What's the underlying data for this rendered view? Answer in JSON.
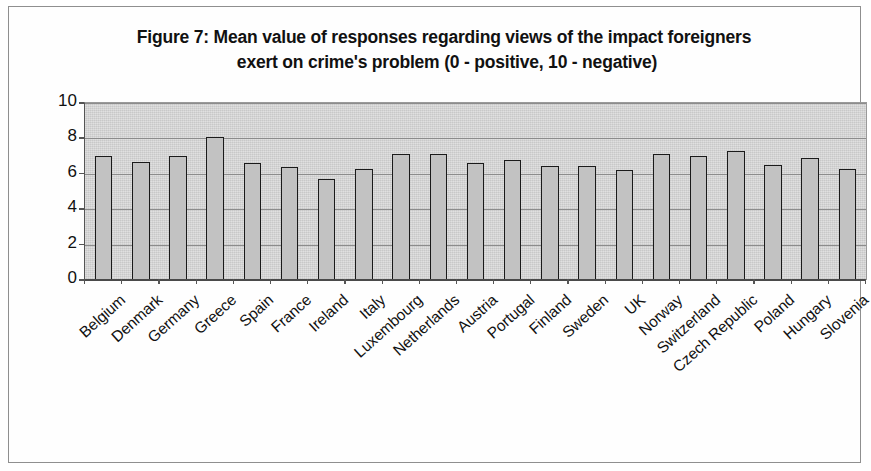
{
  "chart_data": {
    "type": "bar",
    "title": "Figure 7: Mean value of responses regarding views of  the  impact foreigners exert on crime's problem (0 - positive, 10 - negative)",
    "title_line1": "Figure 7: Mean value of responses regarding views of  the  impact foreigners",
    "title_line2": "exert on crime's problem (0 - positive, 10 - negative)",
    "xlabel": "",
    "ylabel": "",
    "ylim": [
      0,
      10
    ],
    "ytick_step": 2,
    "ytick_labels": [
      "10",
      "8",
      "6",
      "4",
      "2",
      "0"
    ],
    "grid": true,
    "grid_orientation": "horizontal",
    "legend": false,
    "legend_position": "none",
    "bar_fill_color": "#c2c2c2",
    "bar_edge_color": "#1a1a1a",
    "plot_background_color": "#d7d7d7",
    "categories": [
      "Belgium",
      "Denmark",
      "Germany",
      "Greece",
      "Spain",
      "France",
      "Ireland",
      "Italy",
      "Luxembourg",
      "Netherlands",
      "Austria",
      "Portugal",
      "Finland",
      "Sweden",
      "UK",
      "Norway",
      "Switzerland",
      "Czech Republic",
      "Poland",
      "Hungary",
      "Slovenia"
    ],
    "values": [
      7.0,
      6.65,
      7.0,
      8.1,
      6.6,
      6.4,
      5.7,
      6.3,
      7.1,
      7.1,
      6.6,
      6.8,
      6.45,
      6.45,
      6.2,
      7.1,
      7.0,
      7.3,
      6.5,
      6.9,
      6.25
    ]
  }
}
